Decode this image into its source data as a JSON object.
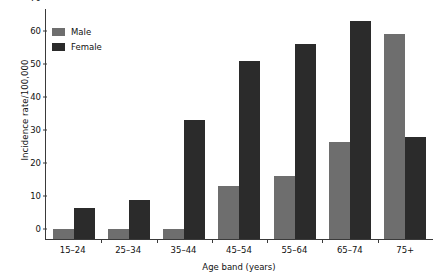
{
  "chart_data": {
    "type": "bar",
    "title": "",
    "xlabel": "Age band (years)",
    "ylabel": "Incidence rate/100,000",
    "categories": [
      "15–24",
      "25–34",
      "35–44",
      "45–54",
      "55–64",
      "65–74",
      "75+"
    ],
    "series": [
      {
        "name": "Male",
        "color": "#6e6e6e",
        "values": [
          3,
          3,
          3,
          16,
          19,
          29.5,
          62
        ]
      },
      {
        "name": "Female",
        "color": "#2b2b2b",
        "values": [
          9.5,
          11.8,
          36,
          54,
          59,
          66,
          31
        ]
      }
    ],
    "ylim": [
      0,
      70
    ],
    "yticks": [
      "0",
      "10",
      "20",
      "30",
      "40",
      "50",
      "60",
      "70"
    ],
    "ytick_values": [
      0,
      10,
      20,
      30,
      40,
      50,
      60,
      70
    ],
    "grid": false,
    "legend_position": "top-left"
  }
}
